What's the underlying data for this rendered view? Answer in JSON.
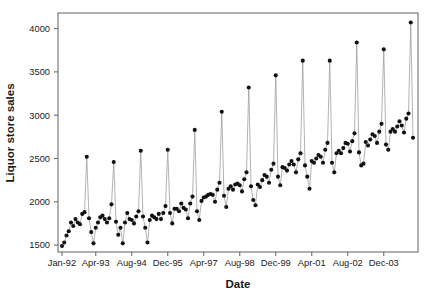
{
  "chart_data": {
    "type": "line",
    "title": "",
    "subtitle": "",
    "xlabel": "Date",
    "ylabel": "Liquor store sales",
    "grid": false,
    "legend": null,
    "marker": "filled-circle",
    "line_color": "#9a9a9a",
    "marker_color": "#111111",
    "frame_color": "#6e6e6e",
    "ylim": [
      1420,
      4180
    ],
    "ytick_values": [
      1500,
      2000,
      2500,
      3000,
      3500,
      4000
    ],
    "ytick_labels": [
      "1500",
      "2000",
      "2500",
      "3000",
      "3500",
      "4000"
    ],
    "xtick_labels": [
      "Jan-92",
      "Apr-93",
      "Aug-94",
      "Dec-95",
      "Apr-97",
      "Aug-98",
      "Dec-99",
      "Apr-01",
      "Aug-02",
      "Dec-03"
    ],
    "xtick_indices": [
      0,
      15,
      31,
      47,
      63,
      79,
      95,
      111,
      127,
      143
    ],
    "x_start_label": "Jan-92",
    "x_end_label": "Dec-04",
    "n_points": 157,
    "x": [
      "Jan-92",
      "Feb-92",
      "Mar-92",
      "Apr-92",
      "May-92",
      "Jun-92",
      "Jul-92",
      "Aug-92",
      "Sep-92",
      "Oct-92",
      "Nov-92",
      "Dec-92",
      "Jan-93",
      "Feb-93",
      "Mar-93",
      "Apr-93",
      "May-93",
      "Jun-93",
      "Jul-93",
      "Aug-93",
      "Sep-93",
      "Oct-93",
      "Nov-93",
      "Dec-93",
      "Jan-94",
      "Feb-94",
      "Mar-94",
      "Apr-94",
      "May-94",
      "Jun-94",
      "Jul-94",
      "Aug-94",
      "Sep-94",
      "Oct-94",
      "Nov-94",
      "Dec-94",
      "Jan-95",
      "Feb-95",
      "Mar-95",
      "Apr-95",
      "May-95",
      "Jun-95",
      "Jul-95",
      "Aug-95",
      "Sep-95",
      "Oct-95",
      "Nov-95",
      "Dec-95",
      "Jan-96",
      "Feb-96",
      "Mar-96",
      "Apr-96",
      "May-96",
      "Jun-96",
      "Jul-96",
      "Aug-96",
      "Sep-96",
      "Oct-96",
      "Nov-96",
      "Dec-96",
      "Jan-97",
      "Feb-97",
      "Mar-97",
      "Apr-97",
      "May-97",
      "Jun-97",
      "Jul-97",
      "Aug-97",
      "Sep-97",
      "Oct-97",
      "Nov-97",
      "Dec-97",
      "Jan-98",
      "Feb-98",
      "Mar-98",
      "Apr-98",
      "May-98",
      "Jun-98",
      "Jul-98",
      "Aug-98",
      "Sep-98",
      "Oct-98",
      "Nov-98",
      "Dec-98",
      "Jan-99",
      "Feb-99",
      "Mar-99",
      "Apr-99",
      "May-99",
      "Jun-99",
      "Jul-99",
      "Aug-99",
      "Sep-99",
      "Oct-99",
      "Nov-99",
      "Dec-99",
      "Jan-00",
      "Feb-00",
      "Mar-00",
      "Apr-00",
      "May-00",
      "Jun-00",
      "Jul-00",
      "Aug-00",
      "Sep-00",
      "Oct-00",
      "Nov-00",
      "Dec-00",
      "Jan-01",
      "Feb-01",
      "Mar-01",
      "Apr-01",
      "May-01",
      "Jun-01",
      "Jul-01",
      "Aug-01",
      "Sep-01",
      "Oct-01",
      "Nov-01",
      "Dec-01",
      "Jan-02",
      "Feb-02",
      "Mar-02",
      "Apr-02",
      "May-02",
      "Jun-02",
      "Jul-02",
      "Aug-02",
      "Sep-02",
      "Oct-02",
      "Nov-02",
      "Dec-02",
      "Jan-03",
      "Feb-03",
      "Mar-03",
      "Apr-03",
      "May-03",
      "Jun-03",
      "Jul-03",
      "Aug-03",
      "Sep-03",
      "Oct-03",
      "Nov-03",
      "Dec-03",
      "Jan-04",
      "Feb-04",
      "Mar-04",
      "Apr-04",
      "May-04",
      "Jun-04",
      "Jul-04",
      "Aug-04",
      "Sep-04",
      "Oct-04",
      "Nov-04",
      "Dec-04",
      "Jan-05"
    ],
    "values": [
      1490,
      1530,
      1610,
      1660,
      1760,
      1720,
      1800,
      1760,
      1740,
      1860,
      1880,
      2520,
      1810,
      1650,
      1520,
      1700,
      1760,
      1820,
      1840,
      1800,
      1760,
      1810,
      1970,
      2460,
      1770,
      1620,
      1700,
      1520,
      1760,
      1870,
      1800,
      1790,
      1750,
      1830,
      1890,
      2590,
      1830,
      1700,
      1530,
      1790,
      1840,
      1820,
      1800,
      1860,
      1800,
      1870,
      1950,
      2600,
      1870,
      1750,
      1920,
      1920,
      1890,
      1980,
      1930,
      1910,
      1810,
      1980,
      2060,
      2830,
      1890,
      1790,
      2010,
      2050,
      2060,
      2080,
      2090,
      2080,
      2000,
      2140,
      2220,
      3040,
      2070,
      1940,
      2150,
      2180,
      2140,
      2200,
      2210,
      2190,
      2120,
      2260,
      2340,
      3320,
      2180,
      2020,
      1960,
      2200,
      2170,
      2250,
      2310,
      2290,
      2220,
      2370,
      2440,
      3460,
      2290,
      2190,
      2400,
      2390,
      2360,
      2430,
      2470,
      2430,
      2340,
      2490,
      2560,
      3630,
      2420,
      2290,
      2150,
      2470,
      2450,
      2500,
      2540,
      2520,
      2450,
      2600,
      2680,
      3630,
      2450,
      2340,
      2560,
      2590,
      2560,
      2620,
      2680,
      2670,
      2580,
      2700,
      2790,
      3840,
      2570,
      2420,
      2440,
      2690,
      2650,
      2720,
      2780,
      2760,
      2680,
      2810,
      2900,
      3760,
      2660,
      2600,
      2810,
      2840,
      2810,
      2870,
      2930,
      2880,
      2800,
      2960,
      3020,
      4070,
      2740
    ]
  }
}
